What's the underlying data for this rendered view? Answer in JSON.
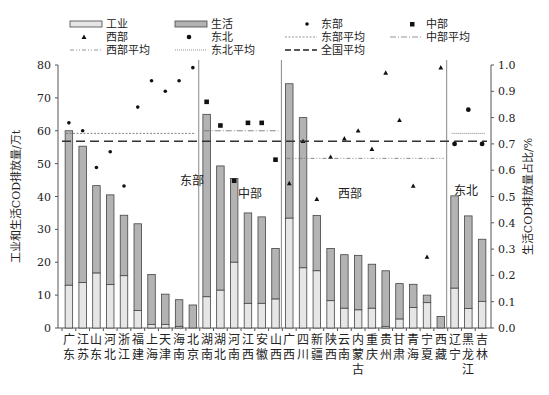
{
  "chart_data": {
    "type": "bar",
    "title": "",
    "xlabel": "",
    "ylabel": "工业和生活COD排放量/万t",
    "y2label": "生活COD排放量占比/%",
    "ylim": [
      0,
      80
    ],
    "yticks": [
      0,
      10,
      20,
      30,
      40,
      50,
      60,
      70,
      80
    ],
    "y2lim": [
      0.0,
      1.0
    ],
    "y2ticks": [
      "0.0",
      "0.1",
      "0.2",
      "0.3",
      "0.4",
      "0.5",
      "0.6",
      "0.7",
      "0.8",
      "0.9",
      "1.0"
    ],
    "grid": false,
    "legend_position": "top",
    "legend": [
      {
        "key": "industry",
        "label": "工业",
        "type": "bar-light"
      },
      {
        "key": "domestic",
        "label": "生活",
        "type": "bar-dark"
      },
      {
        "key": "east",
        "label": "东部",
        "type": "marker-diamond"
      },
      {
        "key": "central",
        "label": "中部",
        "type": "marker-square"
      },
      {
        "key": "west",
        "label": "西部",
        "type": "marker-triangle"
      },
      {
        "key": "northeast",
        "label": "东北",
        "type": "marker-circle"
      },
      {
        "key": "east_avg",
        "label": "东部平均",
        "type": "line-dotted"
      },
      {
        "key": "central_avg",
        "label": "中部平均",
        "type": "line-dashdot"
      },
      {
        "key": "west_avg",
        "label": "西部平均",
        "type": "line-dashdotdot"
      },
      {
        "key": "northeast_avg",
        "label": "东北平均",
        "type": "line-finedot"
      },
      {
        "key": "national_avg",
        "label": "全国平均",
        "type": "line-dashed"
      }
    ],
    "regions": [
      {
        "key": "east",
        "label": "东部",
        "marker": "diamond",
        "avg": 0.74,
        "provinces": [
          {
            "name": "广东",
            "total": 60.0,
            "industry": 13.0,
            "ratio": 0.78
          },
          {
            "name": "江苏",
            "total": 55.3,
            "industry": 13.8,
            "ratio": 0.75
          },
          {
            "name": "山东",
            "total": 43.3,
            "industry": 16.7,
            "ratio": 0.61
          },
          {
            "name": "河北",
            "total": 40.5,
            "industry": 13.2,
            "ratio": 0.67
          },
          {
            "name": "浙江",
            "total": 34.3,
            "industry": 15.9,
            "ratio": 0.54
          },
          {
            "name": "福建",
            "total": 31.7,
            "industry": 5.3,
            "ratio": 0.84
          },
          {
            "name": "上海",
            "total": 16.3,
            "industry": 1.1,
            "ratio": 0.94
          },
          {
            "name": "天津",
            "total": 10.3,
            "industry": 1.1,
            "ratio": 0.9
          },
          {
            "name": "海南",
            "total": 8.6,
            "industry": 0.5,
            "ratio": 0.94
          },
          {
            "name": "北京",
            "total": 7.0,
            "industry": 0.0,
            "ratio": 0.99
          }
        ]
      },
      {
        "key": "central",
        "label": "中部",
        "marker": "square",
        "avg": 0.75,
        "provinces": [
          {
            "name": "湖南",
            "total": 65.0,
            "industry": 9.5,
            "ratio": 0.86
          },
          {
            "name": "湖北",
            "total": 49.3,
            "industry": 11.5,
            "ratio": 0.77
          },
          {
            "name": "河南",
            "total": 45.5,
            "industry": 20.0,
            "ratio": 0.56
          },
          {
            "name": "江西",
            "total": 35.0,
            "industry": 7.5,
            "ratio": 0.78
          },
          {
            "name": "安徽",
            "total": 33.8,
            "industry": 7.5,
            "ratio": 0.78
          },
          {
            "name": "山西",
            "total": 24.2,
            "industry": 8.8,
            "ratio": 0.64
          }
        ]
      },
      {
        "key": "west",
        "label": "西部",
        "marker": "triangle",
        "avg": 0.645,
        "provinces": [
          {
            "name": "广西",
            "total": 74.3,
            "industry": 33.4,
            "ratio": 0.55
          },
          {
            "name": "四川",
            "total": 64.0,
            "industry": 18.3,
            "ratio": 0.71
          },
          {
            "name": "新疆",
            "total": 34.2,
            "industry": 17.4,
            "ratio": 0.49
          },
          {
            "name": "陕西",
            "total": 24.2,
            "industry": 8.3,
            "ratio": 0.65
          },
          {
            "name": "云南",
            "total": 22.3,
            "industry": 6.0,
            "ratio": 0.72
          },
          {
            "name": "内蒙古",
            "total": 22.1,
            "industry": 5.5,
            "ratio": 0.75
          },
          {
            "name": "重庆",
            "total": 19.4,
            "industry": 6.0,
            "ratio": 0.68
          },
          {
            "name": "贵州",
            "total": 17.4,
            "industry": 0.5,
            "ratio": 0.97
          },
          {
            "name": "甘肃",
            "total": 13.5,
            "industry": 2.7,
            "ratio": 0.79
          },
          {
            "name": "青海",
            "total": 13.3,
            "industry": 6.2,
            "ratio": 0.54
          },
          {
            "name": "宁夏",
            "total": 10.0,
            "industry": 7.7,
            "ratio": 0.27
          },
          {
            "name": "西藏",
            "total": 3.5,
            "industry": 0.0,
            "ratio": 0.99
          }
        ]
      },
      {
        "key": "northeast",
        "label": "东北",
        "marker": "circle",
        "avg": 0.74,
        "provinces": [
          {
            "name": "辽宁",
            "total": 40.2,
            "industry": 12.1,
            "ratio": 0.7
          },
          {
            "name": "黑龙江",
            "total": 34.1,
            "industry": 5.9,
            "ratio": 0.83
          },
          {
            "name": "吉林",
            "total": 27.0,
            "industry": 8.1,
            "ratio": 0.7
          }
        ]
      }
    ],
    "national_avg": 0.71,
    "colors": {
      "industry": "#e6e6e6",
      "domestic": "#b3b3b3",
      "edge": "#444444",
      "marker": "#111111",
      "divider": "#888888"
    }
  }
}
